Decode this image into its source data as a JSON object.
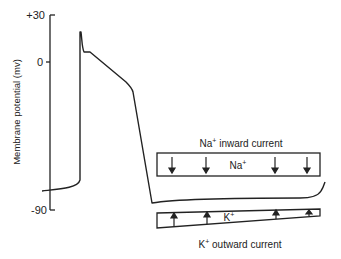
{
  "diagram": {
    "y_axis": {
      "label": "Membrane potential (mv)",
      "ticks": [
        {
          "label": "+30",
          "value": 30
        },
        {
          "label": "0",
          "value": 0
        },
        {
          "label": "-90",
          "value": -90
        }
      ]
    },
    "na_panel": {
      "title_ion": "Na",
      "title_charge": "+",
      "title_rest": " inward current",
      "inner_ion": "Na",
      "inner_charge": "+",
      "arrow_direction": "down",
      "arrow_count": 4
    },
    "k_panel": {
      "title_ion": "K",
      "title_charge": "+",
      "title_rest": " outward current",
      "inner_ion": "K",
      "inner_charge": "+",
      "arrow_direction": "up",
      "arrow_count": 4
    },
    "colors": {
      "line": "#222222",
      "background": "#ffffff"
    }
  }
}
